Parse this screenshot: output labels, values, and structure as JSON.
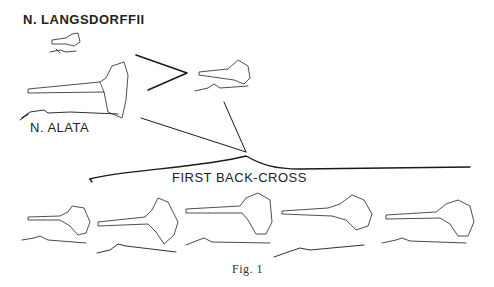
{
  "figure": {
    "labels": {
      "parent_1": "N. LANGSDORFFII",
      "parent_2": "N. ALATA",
      "generation": "FIRST BACK-CROSS"
    },
    "caption": "Fig. 1"
  }
}
